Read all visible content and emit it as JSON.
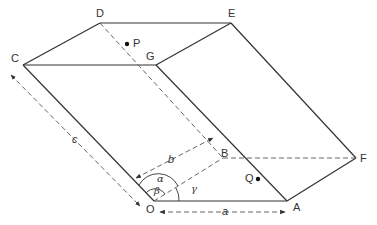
{
  "figure": {
    "type": "parallelepiped-unit-cell",
    "colors": {
      "line": "#333333",
      "dashed": "#555555",
      "background": "#ffffff"
    }
  },
  "vertices": {
    "O": "O",
    "A": "A",
    "B": "B",
    "C": "C",
    "D": "D",
    "E": "E",
    "F": "F",
    "G": "G"
  },
  "points": {
    "P": "P",
    "Q": "Q"
  },
  "edges": {
    "a": "a",
    "b": "b",
    "c": "c"
  },
  "angles": {
    "alpha": "α",
    "beta": "β",
    "gamma": "γ"
  }
}
